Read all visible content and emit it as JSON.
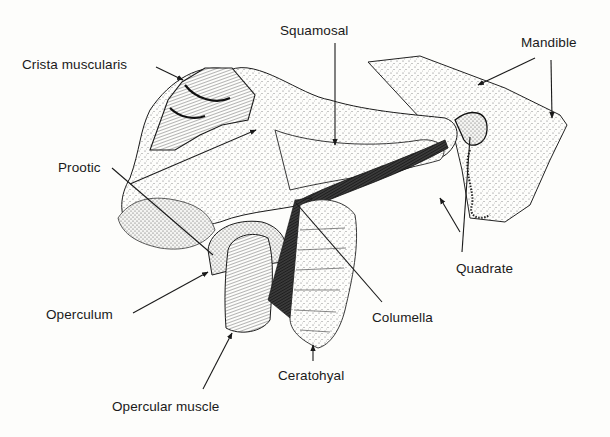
{
  "figure": {
    "labels": [
      {
        "id": "squamosal",
        "text": "Squamosal",
        "x": 280,
        "y": 24
      },
      {
        "id": "mandible",
        "text": "Mandible",
        "x": 521,
        "y": 36
      },
      {
        "id": "crista-muscularis",
        "text": "Crista muscularis",
        "x": 22,
        "y": 58
      },
      {
        "id": "prootic",
        "text": "Prootic",
        "x": 58,
        "y": 161
      },
      {
        "id": "operculum",
        "text": "Operculum",
        "x": 46,
        "y": 308
      },
      {
        "id": "opercular-muscle",
        "text": "Opercular muscle",
        "x": 112,
        "y": 400
      },
      {
        "id": "ceratohyal",
        "text": "Ceratohyal",
        "x": 278,
        "y": 369
      },
      {
        "id": "columella",
        "text": "Columella",
        "x": 372,
        "y": 311
      },
      {
        "id": "quadrate",
        "text": "Quadrate",
        "x": 456,
        "y": 262
      }
    ],
    "colors": {
      "ink": "#1a1a1a",
      "stipple": "#6b6b6b",
      "paper": "#fdfdfb",
      "dark_fill": "#2b2b2b"
    }
  }
}
